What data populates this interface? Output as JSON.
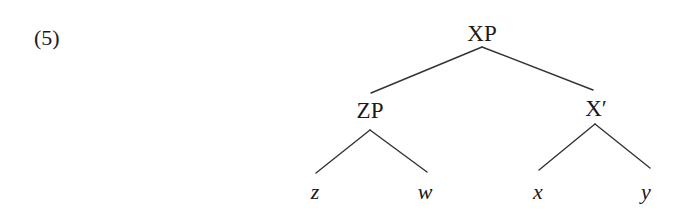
{
  "example": {
    "number": "(5)"
  },
  "tree": {
    "root": {
      "label": "XP"
    },
    "left": {
      "label": "ZP",
      "children": [
        "z",
        "w"
      ]
    },
    "right": {
      "label": "X′",
      "children": [
        "x",
        "y"
      ]
    }
  },
  "style": {
    "line_color": "#333333",
    "text_color": "#1a1a1a",
    "background": "#ffffff"
  }
}
